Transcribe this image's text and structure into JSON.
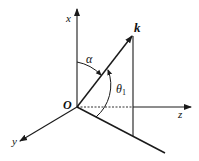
{
  "diagram": {
    "type": "3d-coordinate-vector-diagram",
    "labels": {
      "x_axis": "x",
      "y_axis": "y",
      "z_axis": "z",
      "origin": "O",
      "vector": "k",
      "angle_alpha": "α",
      "angle_theta": "θ",
      "angle_theta_sub": "1"
    },
    "colors": {
      "line": "#1a1a1a",
      "background": "#ffffff"
    }
  }
}
